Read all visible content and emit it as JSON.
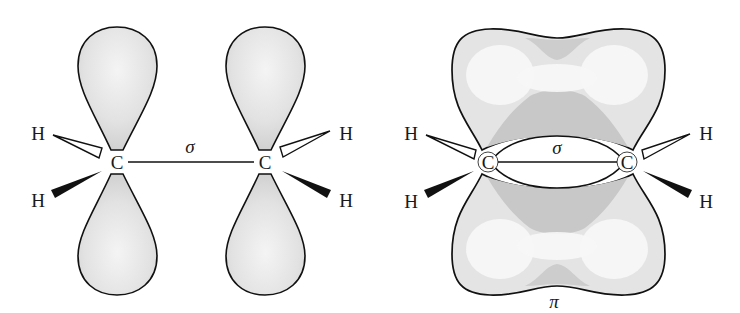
{
  "diagram": {
    "type": "orbital-diagram",
    "colors": {
      "lobe_fill": "#e6e6e6",
      "lobe_dark": "#c9c9c9",
      "outline": "#111111",
      "background": "#ffffff"
    },
    "left_panel": {
      "description": "Two unhybridized p orbitals on sp2 carbons joined by a sigma bond",
      "atoms": [
        {
          "label": "C",
          "x": 117,
          "y": 162
        },
        {
          "label": "C",
          "x": 265,
          "y": 162
        }
      ],
      "hydrogens": [
        {
          "label": "H",
          "x": 38,
          "y": 140,
          "bond": "hashed-open-wedge"
        },
        {
          "label": "H",
          "x": 38,
          "y": 200,
          "bond": "solid-wedge"
        },
        {
          "label": "H",
          "x": 344,
          "y": 140,
          "bond": "hashed-open-wedge"
        },
        {
          "label": "H",
          "x": 344,
          "y": 200,
          "bond": "solid-wedge"
        }
      ],
      "bond_label": "σ"
    },
    "right_panel": {
      "description": "Overlapping p orbitals form a pi bond above and below the sigma bond",
      "atoms": [
        {
          "label": "C",
          "x": 488,
          "y": 162
        },
        {
          "label": "C",
          "x": 627,
          "y": 162
        }
      ],
      "hydrogens": [
        {
          "label": "H",
          "x": 410,
          "y": 140,
          "bond": "hashed-open-wedge"
        },
        {
          "label": "H",
          "x": 410,
          "y": 200,
          "bond": "solid-wedge"
        },
        {
          "label": "H",
          "x": 706,
          "y": 140,
          "bond": "hashed-open-wedge"
        },
        {
          "label": "H",
          "x": 706,
          "y": 200,
          "bond": "solid-wedge"
        }
      ],
      "sigma_label": "σ",
      "pi_label": "π"
    }
  }
}
